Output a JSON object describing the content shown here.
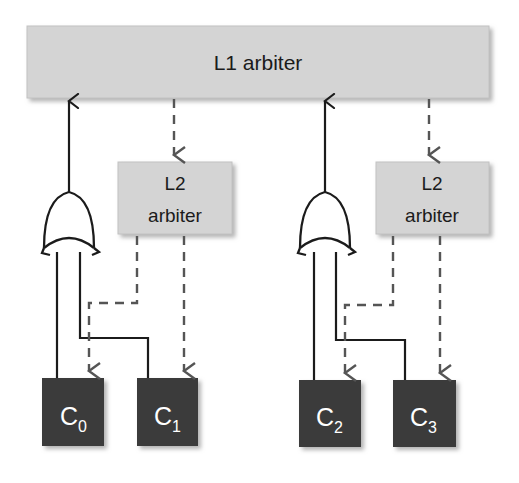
{
  "diagram": {
    "type": "block-diagram",
    "colors": {
      "arbiter_fill": "#d4d4d4",
      "arbiter_stroke": "#bdbdbd",
      "core_fill": "#3b3b3b",
      "core_text": "#ffffff",
      "line": "#1b1b1b",
      "background": "#ffffff",
      "shadow": "#b0b0b0"
    },
    "l1_arbiter": {
      "label": "L1 arbiter"
    },
    "l2_arbiters": [
      {
        "label_line1": "L2",
        "label_line2": "arbiter"
      },
      {
        "label_line1": "L2",
        "label_line2": "arbiter"
      }
    ],
    "or_gates": [
      {
        "name": "or-gate-left",
        "inputs": 2
      },
      {
        "name": "or-gate-right",
        "inputs": 2
      }
    ],
    "cores": [
      {
        "label": "C",
        "subscript": "0"
      },
      {
        "label": "C",
        "subscript": "1"
      },
      {
        "label": "C",
        "subscript": "2"
      },
      {
        "label": "C",
        "subscript": "3"
      }
    ],
    "edges": [
      {
        "from": "or-gate-left",
        "to": "l1-arbiter",
        "style": "solid",
        "direction": "up"
      },
      {
        "from": "l1-arbiter",
        "to": "l2-arbiter-left",
        "style": "dashed",
        "direction": "down"
      },
      {
        "from": "or-gate-right",
        "to": "l1-arbiter",
        "style": "solid",
        "direction": "up"
      },
      {
        "from": "l1-arbiter",
        "to": "l2-arbiter-right",
        "style": "dashed",
        "direction": "down"
      },
      {
        "from": "core-0",
        "to": "or-gate-left",
        "style": "solid",
        "direction": "up"
      },
      {
        "from": "core-1",
        "to": "or-gate-left",
        "style": "solid",
        "direction": "up"
      },
      {
        "from": "l2-arbiter-left",
        "to": "core-0",
        "style": "dashed",
        "direction": "down"
      },
      {
        "from": "l2-arbiter-left",
        "to": "core-1",
        "style": "dashed",
        "direction": "down"
      },
      {
        "from": "core-2",
        "to": "or-gate-right",
        "style": "solid",
        "direction": "up"
      },
      {
        "from": "core-3",
        "to": "or-gate-right",
        "style": "solid",
        "direction": "up"
      },
      {
        "from": "l2-arbiter-right",
        "to": "core-2",
        "style": "dashed",
        "direction": "down"
      },
      {
        "from": "l2-arbiter-right",
        "to": "core-3",
        "style": "dashed",
        "direction": "down"
      }
    ]
  }
}
